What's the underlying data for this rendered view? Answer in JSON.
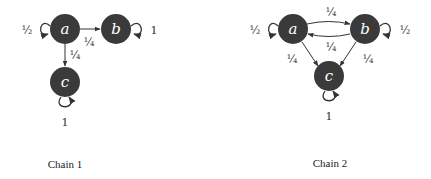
{
  "chain1": {
    "caption": "Chain 1",
    "nodes": {
      "a": "a",
      "b": "b",
      "c": "c"
    },
    "edges": {
      "a_a": "½",
      "a_b": "¼",
      "a_c": "¼",
      "b_b": "1",
      "c_c": "1"
    }
  },
  "chain2": {
    "caption": "Chain 2",
    "nodes": {
      "a": "a",
      "b": "b",
      "c": "c"
    },
    "edges": {
      "a_a": "½",
      "a_b": "¼",
      "b_a": "¼",
      "a_c": "¼",
      "b_c": "¼",
      "b_b": "½",
      "c_c": "1"
    }
  },
  "colors": {
    "node_fill": "#3a3a3a",
    "node_text": "#ffffff",
    "edge": "#333333"
  }
}
